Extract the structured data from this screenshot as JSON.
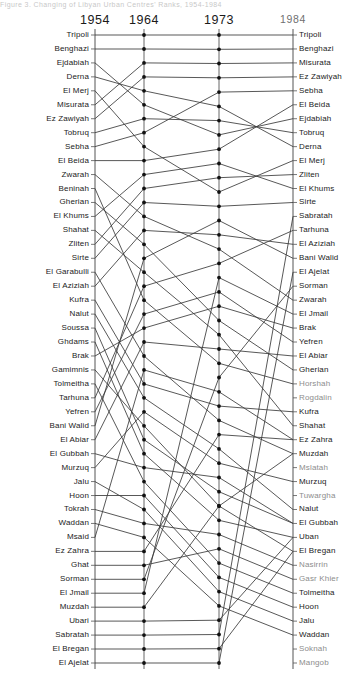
{
  "title": "Figure 3. Changing of Libyan Urban Centres' Ranks, 1954-1984",
  "axes": {
    "years": [
      "1954",
      "1964",
      "1973",
      "1984"
    ],
    "x_positions": [
      95,
      144,
      219,
      293
    ],
    "top_y": 35,
    "row_step": 17.44,
    "rows": 37
  },
  "style": {
    "line_color": "#3a3a3a",
    "dot_color": "#111111",
    "axis_color": "#555555",
    "text_color": "#1b1b1b"
  },
  "chart_data": {
    "type": "line",
    "title": "Changing of Libyan Urban Centres' Ranks, 1954-1984",
    "xlabel": "Year",
    "ylabel": "Rank",
    "grid": false,
    "legend": "none",
    "categories": [
      "1954",
      "1964",
      "1973",
      "1984"
    ],
    "ylim": [
      1,
      37
    ],
    "ranks_1954": [
      "Tripoli",
      "Benghazi",
      "Ejdabiah",
      "Derna",
      "El Merj",
      "Misurata",
      "Ez Zawiyah",
      "Tobruq",
      "Sebha",
      "El Beida",
      "Zwarah",
      "Beninah",
      "Gherian",
      "El Khums",
      "Shahat",
      "Zliten",
      "Sirte",
      "El Garabulli",
      "El Aziziah",
      "Kufra",
      "Nalut",
      "Soussa",
      "Ghdams",
      "Brak",
      "Gamimnis",
      "Tolmeitha",
      "Tarhuna",
      "Yefren",
      "Bani Walid",
      "El Abiar",
      "El Gubbah",
      "Murzuq",
      "Jalu",
      "Hoon",
      "Tokrah",
      "Waddan",
      "Msaid",
      "Ez Zahra",
      "Ghat",
      "Sorman",
      "El Jmail",
      "Muzdah",
      "Ubari",
      "Sabratah",
      "El  Bregan",
      "El Ajelat"
    ],
    "ranks_1984": [
      "Tripoli",
      "Benghazi",
      "Misurata",
      "Ez Zawiyah",
      "Sebha",
      "El Beida",
      "Ejdabiah",
      "Tobruq",
      "Derna",
      "El Merj",
      "Zliten",
      "El Khums",
      "Sirte",
      "Sabratah",
      "Tarhuna",
      "El Aziziah",
      "Bani Walid",
      "El Ajelat",
      "Sorman",
      "Zwarah",
      "El Jmail",
      "Brak",
      "Yefren",
      "El Abiar",
      "Gherian",
      "Horshah",
      "Rogdalin",
      "Kufra",
      "Shahat",
      "Ez Zahra",
      "Muzdah",
      "Mslatah",
      "Murzuq",
      "Tuwargha",
      "Nalut",
      "El Gubbah",
      "Uban",
      "El  Bregan",
      "Nasirrin",
      "Gasr Khier",
      "Tolmeitha",
      "Hoon",
      "Jalu",
      "Waddan",
      "Soknah",
      "Mangob"
    ],
    "series": [
      {
        "name": "Tripoli",
        "values": [
          1,
          1,
          1,
          1
        ]
      },
      {
        "name": "Benghazi",
        "values": [
          2,
          2,
          2,
          2
        ]
      },
      {
        "name": "Ejdabiah",
        "values": [
          3,
          6,
          8,
          7
        ]
      },
      {
        "name": "Derna",
        "values": [
          4,
          5,
          6,
          9
        ]
      },
      {
        "name": "El Merj",
        "values": [
          5,
          9,
          12,
          10
        ]
      },
      {
        "name": "Misurata",
        "values": [
          6,
          3,
          3,
          3
        ]
      },
      {
        "name": "Ez Zawiyah",
        "values": [
          7,
          4,
          4,
          4
        ]
      },
      {
        "name": "Tobruq",
        "values": [
          8,
          7,
          7,
          8
        ]
      },
      {
        "name": "Sebha",
        "values": [
          9,
          8,
          5,
          5
        ]
      },
      {
        "name": "El Beida",
        "values": [
          10,
          10,
          9,
          6
        ]
      },
      {
        "name": "Zwarah",
        "values": [
          11,
          14,
          16,
          20
        ]
      },
      {
        "name": "Beninah",
        "values": [
          12,
          20,
          24,
          26
        ]
      },
      {
        "name": "Gherian",
        "values": [
          13,
          16,
          21,
          25
        ]
      },
      {
        "name": "El Khums",
        "values": [
          14,
          11,
          10,
          12
        ]
      },
      {
        "name": "Shahat",
        "values": [
          15,
          18,
          22,
          29
        ]
      },
      {
        "name": "Zliten",
        "values": [
          16,
          12,
          11,
          11
        ]
      },
      {
        "name": "Sirte",
        "values": [
          17,
          13,
          13,
          13
        ]
      },
      {
        "name": "El Garabulli",
        "values": [
          18,
          24,
          28,
          31
        ]
      },
      {
        "name": "El Aziziah",
        "values": [
          19,
          15,
          15,
          16
        ]
      },
      {
        "name": "Kufra",
        "values": [
          20,
          26,
          27,
          28
        ]
      },
      {
        "name": "Nalut",
        "values": [
          21,
          27,
          30,
          35
        ]
      },
      {
        "name": "Soussa",
        "values": [
          22,
          30,
          33,
          36
        ]
      },
      {
        "name": "Ghdams",
        "values": [
          23,
          31,
          35,
          37
        ]
      },
      {
        "name": "Brak",
        "values": [
          24,
          22,
          20,
          22
        ]
      },
      {
        "name": "Gamimnis",
        "values": [
          25,
          29,
          34,
          38
        ]
      },
      {
        "name": "Tolmeitha",
        "values": [
          26,
          33,
          38,
          41
        ]
      },
      {
        "name": "Tarhuna",
        "values": [
          27,
          19,
          17,
          15
        ]
      },
      {
        "name": "Yefren",
        "values": [
          28,
          21,
          19,
          23
        ]
      },
      {
        "name": "Bani Walid",
        "values": [
          29,
          17,
          14,
          17
        ]
      },
      {
        "name": "El Abiar",
        "values": [
          30,
          23,
          23,
          24
        ]
      },
      {
        "name": "El Gubbah",
        "values": [
          31,
          32,
          32,
          36
        ]
      },
      {
        "name": "Murzuq",
        "values": [
          32,
          28,
          31,
          33
        ]
      },
      {
        "name": "Jalu",
        "values": [
          33,
          35,
          40,
          43
        ]
      },
      {
        "name": "Hoon",
        "values": [
          34,
          34,
          39,
          42
        ]
      },
      {
        "name": "Tokrah",
        "values": [
          35,
          36,
          36,
          39
        ]
      },
      {
        "name": "Waddan",
        "values": [
          36,
          37,
          41,
          44
        ]
      },
      {
        "name": "Msaid",
        "values": [
          37,
          25,
          26,
          30
        ]
      },
      {
        "name": "Ez Zahra",
        "values": [
          38,
          38,
          29,
          30
        ]
      },
      {
        "name": "Ghat",
        "values": [
          39,
          39,
          37,
          40
        ]
      },
      {
        "name": "Sorman",
        "values": [
          40,
          40,
          25,
          19
        ]
      },
      {
        "name": "El Jmail",
        "values": [
          41,
          41,
          18,
          21
        ]
      },
      {
        "name": "Muzdah",
        "values": [
          42,
          42,
          34,
          31
        ]
      },
      {
        "name": "Ubari",
        "values": [
          43,
          43,
          42,
          37
        ]
      },
      {
        "name": "Sabratah",
        "values": [
          44,
          44,
          43,
          14
        ]
      },
      {
        "name": "El  Bregan",
        "values": [
          45,
          45,
          44,
          38
        ]
      },
      {
        "name": "El Ajelat",
        "values": [
          46,
          46,
          45,
          18
        ]
      }
    ]
  }
}
